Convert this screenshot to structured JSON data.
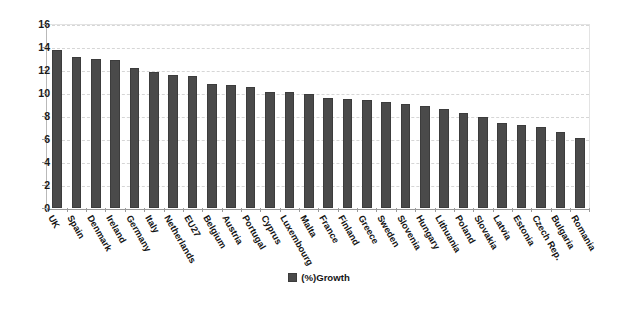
{
  "chart_data": {
    "type": "bar",
    "title": "",
    "xlabel": "",
    "ylabel": "",
    "ylim": [
      0,
      16
    ],
    "ytick_step": 2,
    "yticks": [
      0,
      2,
      4,
      6,
      8,
      10,
      12,
      14,
      16
    ],
    "grid": true,
    "legend_position": "bottom",
    "legend": [
      "(%)Growth"
    ],
    "series_name": "(%)Growth",
    "bar_color": "#4a4a4a",
    "categories": [
      "UK",
      "Spain",
      "Denmark",
      "Ireland",
      "Germany",
      "Italy",
      "Netherlands",
      "EU27",
      "Belgium",
      "Austria",
      "Portugal",
      "Cyprus",
      "Luxembourg",
      "Malta",
      "France",
      "Finland",
      "Greece",
      "Sweden",
      "Slovenia",
      "Hungary",
      "Lithuania",
      "Poland",
      "Slovakia",
      "Latvia",
      "Estonia",
      "Czech Rep.",
      "Bulgaria",
      "Romania"
    ],
    "values": [
      13.7,
      13.1,
      13.0,
      12.9,
      12.2,
      11.8,
      11.6,
      11.5,
      10.8,
      10.7,
      10.5,
      10.1,
      10.1,
      9.95,
      9.6,
      9.45,
      9.35,
      9.2,
      9.05,
      8.9,
      8.6,
      8.3,
      7.9,
      7.35,
      7.2,
      7.05,
      6.6,
      6.1
    ]
  },
  "legend_label": "(%)Growth"
}
